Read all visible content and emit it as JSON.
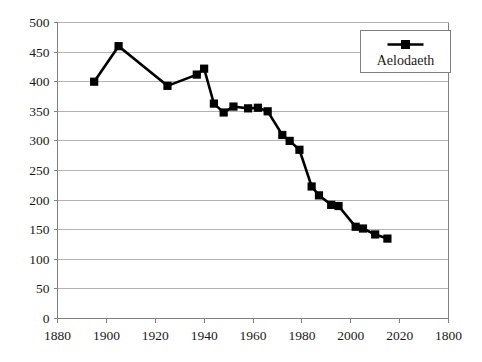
{
  "chart_data": {
    "type": "line",
    "title": "",
    "subtitle": "",
    "xlabel": "",
    "ylabel": "",
    "xlim": [
      1880,
      2040
    ],
    "ylim": [
      0,
      500
    ],
    "grid": "horizontal",
    "legend_position": "top-right",
    "series": [
      {
        "name": "Aelodaeth",
        "marker": "filled-square",
        "color": "#000000",
        "x": [
          1895,
          1905,
          1925,
          1937,
          1940,
          1944,
          1948,
          1952,
          1958,
          1962,
          1966,
          1972,
          1975,
          1979,
          1984,
          1987,
          1992,
          1995,
          2002,
          2005,
          2010,
          2015
        ],
        "values": [
          400,
          460,
          393,
          412,
          422,
          363,
          348,
          358,
          355,
          356,
          350,
          310,
          300,
          285,
          223,
          208,
          192,
          190,
          155,
          152,
          142,
          135
        ]
      }
    ],
    "x_ticks": [
      {
        "value": 1880,
        "label": "1880"
      },
      {
        "value": 1900,
        "label": "1900"
      },
      {
        "value": 1920,
        "label": "1920"
      },
      {
        "value": 1940,
        "label": "1940"
      },
      {
        "value": 1960,
        "label": "1960"
      },
      {
        "value": 1980,
        "label": "1980"
      },
      {
        "value": 2000,
        "label": "2000"
      },
      {
        "value": 2020,
        "label": "2020"
      },
      {
        "value": 2040,
        "label": "1800"
      }
    ],
    "y_ticks": [
      {
        "value": 0,
        "label": "0"
      },
      {
        "value": 50,
        "label": "50"
      },
      {
        "value": 100,
        "label": "100"
      },
      {
        "value": 150,
        "label": "150"
      },
      {
        "value": 200,
        "label": "200"
      },
      {
        "value": 250,
        "label": "250"
      },
      {
        "value": 300,
        "label": "300"
      },
      {
        "value": 350,
        "label": "350"
      },
      {
        "value": 400,
        "label": "400"
      },
      {
        "value": 450,
        "label": "450"
      },
      {
        "value": 500,
        "label": "500"
      }
    ],
    "colors": {
      "line": "#000000",
      "marker": "#000000",
      "gridline": "#b3b3b3",
      "axis": "#808080",
      "text": "#1a1a1a",
      "plot_background": "#ffffff",
      "legend_border": "#808080"
    }
  },
  "legend": {
    "entries": [
      {
        "label": "Aelodaeth",
        "marker": "filled-square"
      }
    ]
  }
}
